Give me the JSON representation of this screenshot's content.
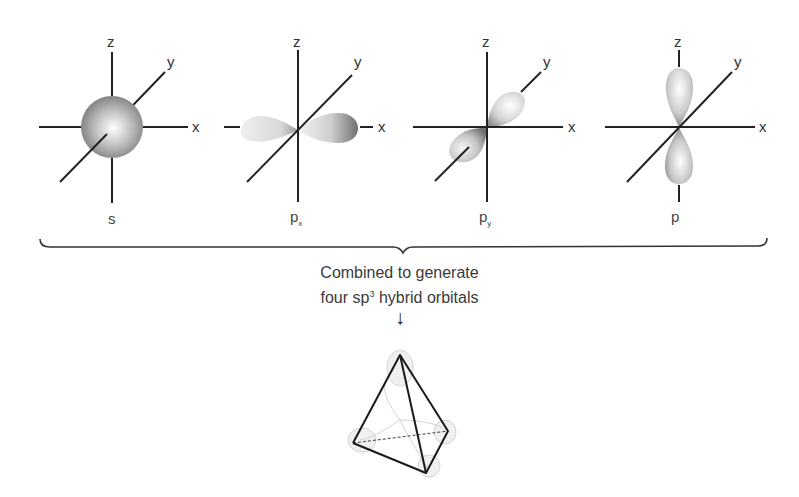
{
  "figure": {
    "orbitals": [
      {
        "id": "s",
        "label": "s",
        "axes": {
          "x": "x",
          "y": "y",
          "z": "z"
        }
      },
      {
        "id": "px",
        "label": "p",
        "subscript": "x",
        "axes": {
          "x": "x",
          "y": "y",
          "z": "z"
        }
      },
      {
        "id": "py",
        "label": "p",
        "subscript": "y",
        "axes": {
          "x": "x",
          "y": "y",
          "z": "z"
        }
      },
      {
        "id": "pz",
        "label": "p",
        "subscript": "z",
        "axes": {
          "x": "x",
          "y": "y",
          "z": "z"
        }
      }
    ],
    "caption": {
      "line1": "Combined to generate",
      "line2_prefix": "four sp",
      "line2_sup": "3",
      "line2_suffix": " hybrid orbitals"
    },
    "arrow": "↓",
    "result": "sp3 tetrahedral hybrid orbitals",
    "colors": {
      "line": "#222222",
      "lobe_dark": "#7a7a7a",
      "lobe_light": "#f4f4f4",
      "ghost": "#d9d9d9"
    }
  }
}
